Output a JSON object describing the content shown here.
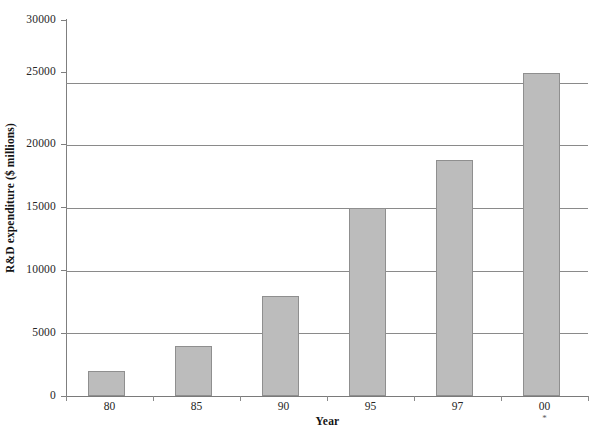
{
  "chart_data": {
    "type": "bar",
    "title": "",
    "xlabel": "Year",
    "ylabel": "R&D expenditure ($ millions)",
    "categories": [
      "80",
      "85",
      "90",
      "95",
      "97",
      "00"
    ],
    "values": [
      2000,
      4000,
      8000,
      15000,
      18800,
      25800
    ],
    "ylim": [
      0,
      30000
    ],
    "ytick_labels": [
      "0",
      "5000",
      "10000",
      "15000",
      "20000",
      "25000",
      "30000"
    ],
    "ytick_values": [
      0,
      5000,
      10000,
      15000,
      20000,
      25000,
      30000
    ],
    "grid": "horizontal",
    "legend": "none",
    "bar_color": "#bcbcbc",
    "bar_border_color": "#8f8f8f",
    "axis_color": "#7a7a7a",
    "gridline_color": "#8a8a8a",
    "annotations": {
      "category_footnotes": [
        "",
        "",
        "",
        "",
        "",
        "*"
      ]
    }
  }
}
